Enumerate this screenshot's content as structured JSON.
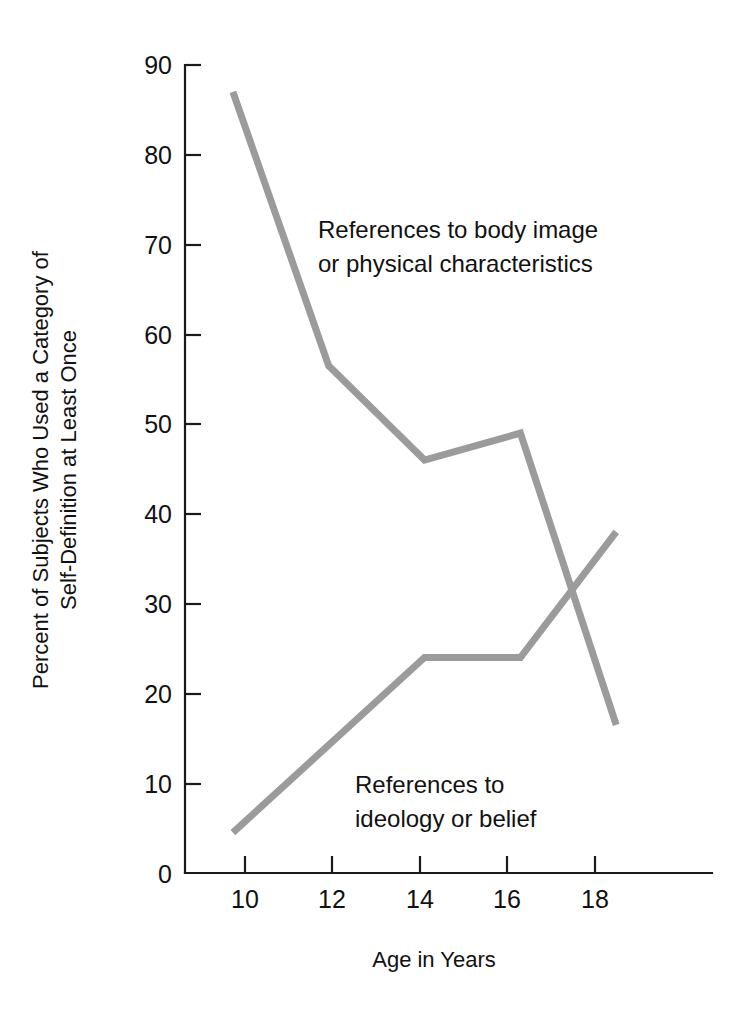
{
  "chart_data": {
    "type": "line",
    "title": "",
    "subtitle": "",
    "xlabel": "Age in Years",
    "ylabel": "Percent of Subjects Who Used a Category of Self-Definition at Least Once",
    "ylabel_lines": [
      "Percent of Subjects Who Used a Category of",
      "Self-Definition at Least Once"
    ],
    "xlim": [
      9,
      20
    ],
    "ylim": [
      0,
      90
    ],
    "xticks": [
      10,
      12,
      14,
      16,
      18
    ],
    "xtick_labels": [
      "10",
      "12",
      "14",
      "16",
      "18"
    ],
    "yticks": [
      0,
      10,
      20,
      30,
      40,
      50,
      60,
      70,
      80,
      90
    ],
    "ytick_labels": [
      "0",
      "10",
      "20",
      "30",
      "40",
      "50",
      "60",
      "70",
      "80",
      "90"
    ],
    "grid": false,
    "legend": "annotations-inline",
    "line_color": "#9b9b9b",
    "axis_color": "#1a1a1a",
    "background": "#ffffff",
    "series": [
      {
        "name": "References to body image or physical characteristics",
        "color": "#9b9b9b",
        "x": [
          10,
          12,
          14,
          16,
          18
        ],
        "values": [
          87,
          56.5,
          46,
          49,
          16.5
        ]
      },
      {
        "name": "References to ideology or belief",
        "color": "#9b9b9b",
        "x": [
          10,
          14,
          16,
          18
        ],
        "values": [
          4.5,
          24,
          24,
          38
        ]
      }
    ],
    "annotations": [
      {
        "name": "body-image-label",
        "lines": [
          "References to body image",
          "or physical characteristics"
        ],
        "x": 318,
        "y": 238
      },
      {
        "name": "ideology-label",
        "lines": [
          "References to",
          "ideology or belief"
        ],
        "x": 355,
        "y": 793
      }
    ]
  }
}
